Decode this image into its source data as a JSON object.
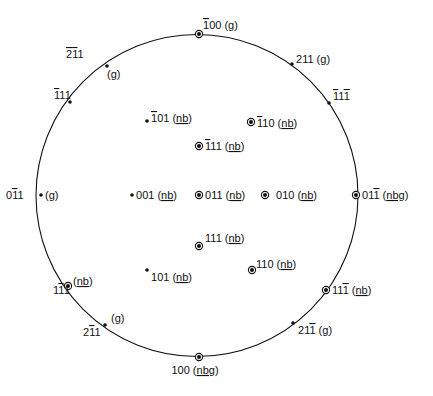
{
  "diagram": {
    "type": "stereographic-projection",
    "colors": {
      "ink": "#111111",
      "background": "#ffffff"
    },
    "marker_legend": {
      "dot": "pole",
      "ringed-dot": "pole with diffraction observation"
    },
    "poles": [
      {
        "id": "p-100bar-top",
        "index": [
          {
            "d": "1",
            "bar": true
          },
          {
            "d": "0"
          },
          {
            "d": "0"
          }
        ],
        "tag": "g",
        "marker": "ringed-dot",
        "on_circle": true
      },
      {
        "id": "p-211",
        "index": [
          {
            "d": "2"
          },
          {
            "d": "1"
          },
          {
            "d": "1"
          }
        ],
        "tag": "g",
        "marker": "dot",
        "on_circle": true
      },
      {
        "id": "p-1bar11bar",
        "index": [
          {
            "d": "1",
            "bar": true
          },
          {
            "d": "1"
          },
          {
            "d": "1",
            "bar": true
          }
        ],
        "tag": "",
        "marker": "dot",
        "on_circle": true
      },
      {
        "id": "p-2bar1bar1",
        "index": [
          {
            "d": "2",
            "bar": true
          },
          {
            "d": "1",
            "bar": true
          },
          {
            "d": "1"
          }
        ],
        "tag": "g",
        "marker": "dot",
        "on_circle": true
      },
      {
        "id": "p-1bar11",
        "index": [
          {
            "d": "1",
            "bar": true
          },
          {
            "d": "1"
          },
          {
            "d": "1"
          }
        ],
        "tag": "",
        "marker": "dot",
        "on_circle": true
      },
      {
        "id": "p-1bar01",
        "index": [
          {
            "d": "1",
            "bar": true
          },
          {
            "d": "0"
          },
          {
            "d": "1"
          }
        ],
        "tag": "nb",
        "marker": "dot",
        "on_circle": false
      },
      {
        "id": "p-1bar10",
        "index": [
          {
            "d": "1",
            "bar": true
          },
          {
            "d": "1"
          },
          {
            "d": "0"
          }
        ],
        "tag": "nb",
        "marker": "ringed-dot",
        "on_circle": false
      },
      {
        "id": "p-1bar11-inner",
        "index": [
          {
            "d": "1",
            "bar": true
          },
          {
            "d": "1"
          },
          {
            "d": "1"
          }
        ],
        "tag": "nb",
        "marker": "ringed-dot",
        "on_circle": false
      },
      {
        "id": "p-01bar1",
        "index": [
          {
            "d": "0"
          },
          {
            "d": "1",
            "bar": true
          },
          {
            "d": "1"
          }
        ],
        "tag": "g",
        "marker": "dot",
        "on_circle": true
      },
      {
        "id": "p-001",
        "index": [
          {
            "d": "0"
          },
          {
            "d": "0"
          },
          {
            "d": "1"
          }
        ],
        "tag": "nb",
        "marker": "dot",
        "on_circle": false
      },
      {
        "id": "p-011",
        "index": [
          {
            "d": "0"
          },
          {
            "d": "1"
          },
          {
            "d": "1"
          }
        ],
        "tag": "nb",
        "marker": "ringed-dot",
        "on_circle": false
      },
      {
        "id": "p-010",
        "index": [
          {
            "d": "0"
          },
          {
            "d": "1"
          },
          {
            "d": "0"
          }
        ],
        "tag": "nb",
        "marker": "ringed-dot",
        "on_circle": false
      },
      {
        "id": "p-011bar",
        "index": [
          {
            "d": "0"
          },
          {
            "d": "1"
          },
          {
            "d": "1",
            "bar": true
          }
        ],
        "tag": "nbg",
        "marker": "ringed-dot",
        "on_circle": true
      },
      {
        "id": "p-111",
        "index": [
          {
            "d": "1"
          },
          {
            "d": "1"
          },
          {
            "d": "1"
          }
        ],
        "tag": "nb",
        "marker": "ringed-dot",
        "on_circle": false
      },
      {
        "id": "p-101",
        "index": [
          {
            "d": "1"
          },
          {
            "d": "0"
          },
          {
            "d": "1"
          }
        ],
        "tag": "nb",
        "marker": "dot",
        "on_circle": false
      },
      {
        "id": "p-110",
        "index": [
          {
            "d": "1"
          },
          {
            "d": "1"
          },
          {
            "d": "0"
          }
        ],
        "tag": "nb",
        "marker": "ringed-dot",
        "on_circle": false
      },
      {
        "id": "p-11bar1",
        "index": [
          {
            "d": "1"
          },
          {
            "d": "1",
            "bar": true
          },
          {
            "d": "1"
          }
        ],
        "tag": "nb",
        "marker": "ringed-dot",
        "on_circle": true
      },
      {
        "id": "p-111bar",
        "index": [
          {
            "d": "1"
          },
          {
            "d": "1"
          },
          {
            "d": "1",
            "bar": true
          }
        ],
        "tag": "nb",
        "marker": "ringed-dot",
        "on_circle": true
      },
      {
        "id": "p-21bar1",
        "index": [
          {
            "d": "2"
          },
          {
            "d": "1",
            "bar": true
          },
          {
            "d": "1"
          }
        ],
        "tag": "g",
        "marker": "dot",
        "on_circle": true
      },
      {
        "id": "p-211bar",
        "index": [
          {
            "d": "2"
          },
          {
            "d": "1"
          },
          {
            "d": "1",
            "bar": true
          }
        ],
        "tag": "g",
        "marker": "dot",
        "on_circle": true
      },
      {
        "id": "p-100",
        "index": [
          {
            "d": "1"
          },
          {
            "d": "0"
          },
          {
            "d": "0"
          }
        ],
        "tag": "nbg",
        "marker": "ringed-dot",
        "on_circle": true
      }
    ]
  }
}
